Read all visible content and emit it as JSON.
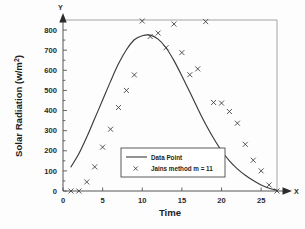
{
  "chart_data": {
    "type": "scatter",
    "title": "",
    "xlabel": "Time",
    "ylabel": "Solar Radiation (w/m2)",
    "ylabel_base": "Solar Radiation (w/m",
    "ylabel_superscript": "2",
    "ylabel_close": ")",
    "x_axis_end_label": "X",
    "y_axis_end_label": "Y",
    "xlim": [
      0,
      27
    ],
    "ylim": [
      0,
      850
    ],
    "xticks": [
      0,
      5,
      10,
      15,
      20,
      25
    ],
    "xticklabels": [
      "0",
      "5",
      "10",
      "15",
      "20",
      "25"
    ],
    "yticks": [
      0,
      100,
      200,
      300,
      400,
      500,
      600,
      700,
      800
    ],
    "yticklabels": [
      "0",
      "100",
      "200",
      "300",
      "400",
      "500",
      "600",
      "700",
      "800"
    ],
    "grid": false,
    "legend_position": "lower center",
    "series": [
      {
        "name": "Data Point",
        "marker": "line",
        "type": "line",
        "x": [
          1,
          2,
          3,
          4,
          5,
          6,
          7,
          8,
          9,
          10,
          11,
          12,
          13,
          14,
          15,
          16,
          17,
          18,
          19,
          20,
          21,
          22,
          23,
          24,
          25,
          26,
          27
        ],
        "y": [
          120,
          185,
          268,
          360,
          452,
          545,
          632,
          702,
          752,
          772,
          775,
          755,
          712,
          648,
          572,
          492,
          410,
          332,
          262,
          200,
          150,
          110,
          78,
          52,
          30,
          14,
          4
        ]
      },
      {
        "name": "Jains method m = 11",
        "marker": "x",
        "type": "scatter",
        "x": [
          1,
          2,
          3,
          4,
          5,
          6,
          7,
          8,
          9,
          10,
          11,
          12,
          13,
          14,
          15,
          16,
          17,
          18,
          19,
          20,
          21,
          22,
          23,
          24,
          25,
          26,
          27
        ],
        "y": [
          0,
          0,
          45,
          120,
          218,
          307,
          415,
          500,
          577,
          845,
          768,
          785,
          712,
          830,
          688,
          578,
          607,
          842,
          440,
          437,
          395,
          337,
          232,
          153,
          100,
          30,
          0
        ]
      }
    ]
  },
  "legend": {
    "entries": [
      {
        "label": "Data Point",
        "symbol": "line"
      },
      {
        "label": "Jains method m = 11",
        "symbol": "x"
      }
    ]
  },
  "colors": {
    "curve": "#3b3b3b",
    "marker": "#3b3b3b",
    "axis": "#555555",
    "frame": "#9a9a9a",
    "text": "#1d1d1d",
    "background": "#fdfdfd"
  }
}
